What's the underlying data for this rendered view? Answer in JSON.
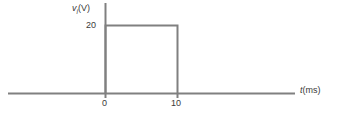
{
  "chart_data": {
    "type": "line",
    "title": "",
    "xlabel": "t (ms)",
    "ylabel": "v_i (V)",
    "xlim": [
      0,
      10
    ],
    "ylim": [
      0,
      20
    ],
    "grid": false,
    "legend": null,
    "x": [
      0,
      0,
      10,
      10
    ],
    "values": [
      0,
      20,
      20,
      0
    ],
    "series": [
      {
        "name": "v_i",
        "x": [
          0,
          0,
          10,
          10
        ],
        "values": [
          0,
          20,
          20,
          0
        ]
      }
    ]
  },
  "axes": {
    "y_title_symbol": "v",
    "y_title_subscript": "i",
    "y_title_unit": "(V)",
    "x_title_symbol": "t",
    "x_title_unit": "(ms)",
    "y_ticks": [
      "20"
    ],
    "x_ticks": [
      "0",
      "10"
    ]
  },
  "colors": {
    "line": "#808080",
    "axis": "#808080",
    "text": "#3a3a3a",
    "background": "#ffffff"
  }
}
